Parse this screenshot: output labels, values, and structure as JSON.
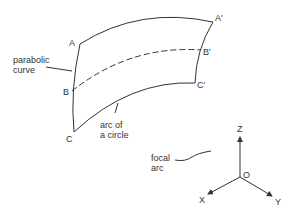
{
  "diagram": {
    "points": {
      "A": "A",
      "A_prime": "A'",
      "B": "B",
      "B_prime": "B'",
      "C": "C",
      "C_prime": "C'"
    },
    "annotations": {
      "parabolic_curve_line1": "parabolic",
      "parabolic_curve_line2": "curve",
      "arc_line1": "arc of",
      "arc_line2": "a circle",
      "focal_line1": "focal",
      "focal_line2": "arc"
    },
    "axes": {
      "z": "Z",
      "x": "X",
      "y": "Y",
      "origin": "O"
    },
    "line_color": "#333333"
  }
}
